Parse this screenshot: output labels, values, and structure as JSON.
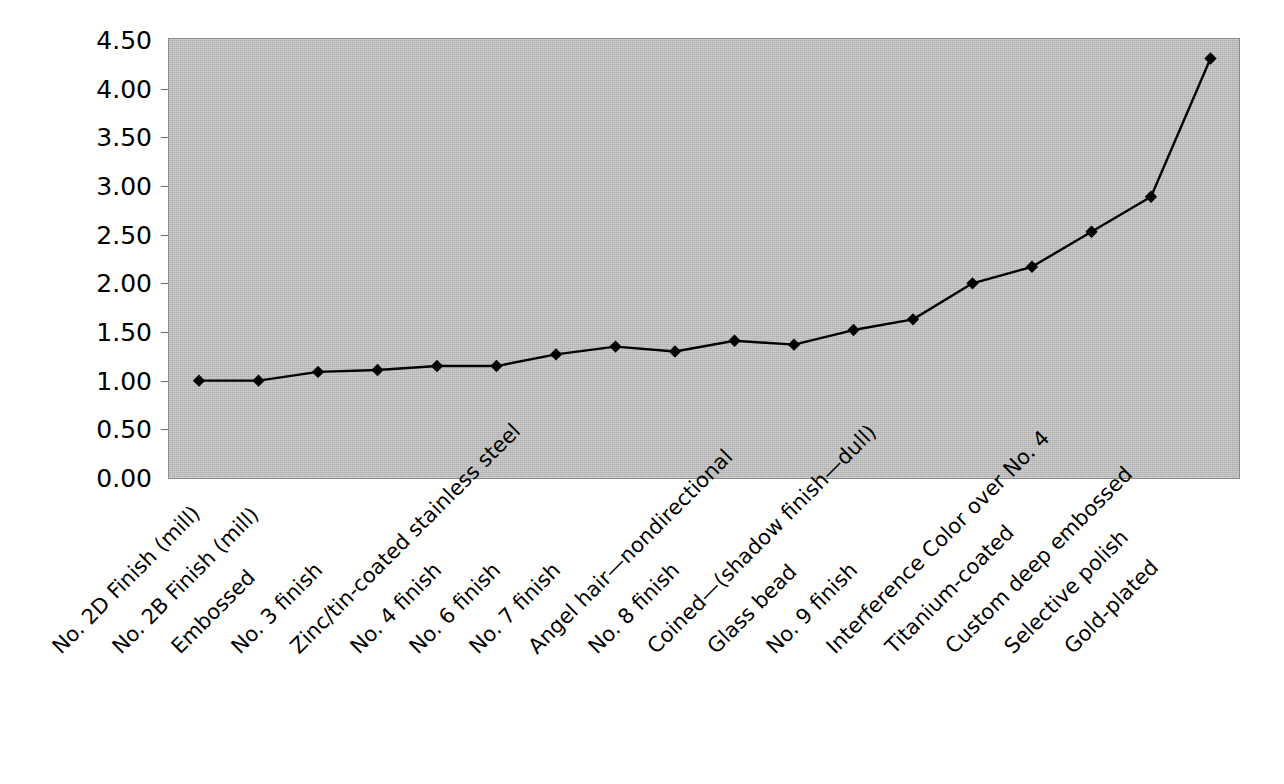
{
  "chart_data": {
    "type": "line",
    "title": "",
    "xlabel": "",
    "ylabel": "",
    "ylim": [
      0.0,
      4.5
    ],
    "ytick_labels": [
      "0.00",
      "0.50",
      "1.00",
      "1.50",
      "2.00",
      "2.50",
      "3.00",
      "3.50",
      "4.00",
      "4.50"
    ],
    "ytick_values": [
      0.0,
      0.5,
      1.0,
      1.5,
      2.0,
      2.5,
      3.0,
      3.5,
      4.0,
      4.5
    ],
    "grid": false,
    "legend": "none",
    "marker": "diamond",
    "line_color": "#000000",
    "marker_color": "#000000",
    "plot_background": "#c0c0c0",
    "categories": [
      "No. 2D Finish (mill)",
      "No. 2B Finish (mill)",
      "Embossed",
      "No. 3 finish",
      "Zinc/tin-coated stainless steel",
      "No. 4 finish",
      "No. 6 finish",
      "No. 7 finish",
      "Angel hair—nondirectional",
      "No. 8 finish",
      "Coined—(shadow finish—dull)",
      "Glass bead",
      "No. 9 finish",
      "Interference Color over No. 4",
      "Titanium-coated",
      "Custom deep embossed",
      "Selective polish",
      "Gold-plated"
    ],
    "values": [
      1.0,
      1.0,
      1.09,
      1.11,
      1.15,
      1.15,
      1.27,
      1.35,
      1.3,
      1.41,
      1.37,
      1.52,
      1.63,
      2.0,
      2.17,
      2.53,
      2.89,
      4.31
    ]
  },
  "caption": {
    "text": ""
  }
}
